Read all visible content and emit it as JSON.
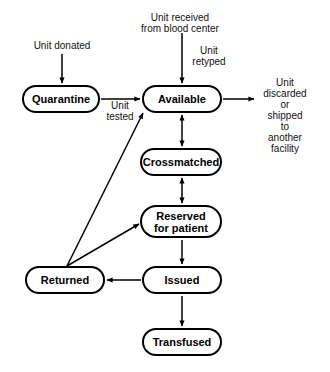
{
  "diagram": {
    "type": "state-flow",
    "stroke_color": "#000000",
    "background_color": "#ffffff",
    "nodes": [
      {
        "id": "quarantine",
        "label": "Quarantine",
        "x": 22,
        "y": 85,
        "w": 78,
        "h": 28
      },
      {
        "id": "available",
        "label": "Available",
        "x": 142,
        "y": 85,
        "w": 80,
        "h": 28
      },
      {
        "id": "crossmatched",
        "label": "Crossmatched",
        "x": 140,
        "y": 148,
        "w": 82,
        "h": 28
      },
      {
        "id": "reserved",
        "label": "Reserved\nfor patient",
        "x": 140,
        "y": 205,
        "w": 82,
        "h": 33
      },
      {
        "id": "returned",
        "label": "Returned",
        "x": 25,
        "y": 266,
        "w": 80,
        "h": 28
      },
      {
        "id": "issued",
        "label": "Issued",
        "x": 142,
        "y": 266,
        "w": 80,
        "h": 28
      },
      {
        "id": "transfused",
        "label": "Transfused",
        "x": 142,
        "y": 328,
        "w": 80,
        "h": 28
      }
    ],
    "edge_labels": [
      {
        "id": "unit-donated",
        "text": "Unit donated",
        "x": 62,
        "y": 40
      },
      {
        "id": "unit-received",
        "text": "Unit received\nfrom blood center",
        "x": 180,
        "y": 14
      },
      {
        "id": "unit-retyped",
        "text": "Unit\nretyped",
        "x": 209,
        "y": 46
      },
      {
        "id": "unit-tested",
        "text": "Unit\ntested",
        "x": 120,
        "y": 99
      },
      {
        "id": "unit-discarded",
        "text": "Unit discarded\nor\nshipped to\nanother facility",
        "x": 285,
        "y": 78
      }
    ],
    "edges": [
      {
        "id": "donated-to-quarantine",
        "from": "Unit donated",
        "to": "Quarantine",
        "arrow": "single"
      },
      {
        "id": "received-to-available",
        "from": "Unit received",
        "to": "Available",
        "arrow": "single"
      },
      {
        "id": "quarantine-to-available",
        "from": "Quarantine",
        "to": "Available",
        "arrow": "single"
      },
      {
        "id": "available-to-discarded",
        "from": "Available",
        "to": "Unit discarded",
        "arrow": "single"
      },
      {
        "id": "available-crossmatched",
        "from": "Available",
        "to": "Crossmatched",
        "arrow": "double"
      },
      {
        "id": "crossmatched-reserved",
        "from": "Crossmatched",
        "to": "Reserved for patient",
        "arrow": "double"
      },
      {
        "id": "reserved-to-issued",
        "from": "Reserved for patient",
        "to": "Issued",
        "arrow": "single"
      },
      {
        "id": "issued-to-transfused",
        "from": "Issued",
        "to": "Transfused",
        "arrow": "single"
      },
      {
        "id": "issued-to-returned",
        "from": "Issued",
        "to": "Returned",
        "arrow": "single"
      },
      {
        "id": "returned-to-available",
        "from": "Returned",
        "to": "Available",
        "arrow": "single"
      },
      {
        "id": "returned-to-reserved",
        "from": "Returned",
        "to": "Reserved for patient",
        "arrow": "single"
      }
    ]
  }
}
